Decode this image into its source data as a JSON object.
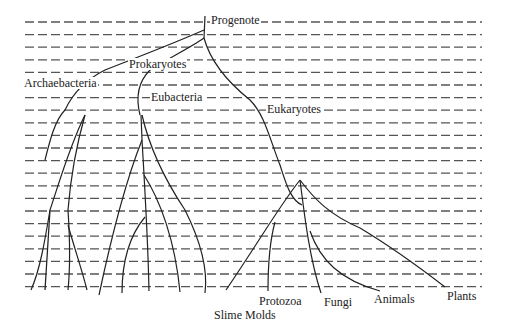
{
  "diagram": {
    "type": "phylogenetic-tree",
    "colors": {
      "line": "#222222",
      "dash": "#555555",
      "background": "#ffffff"
    },
    "nodes": {
      "root": "Progenote",
      "prokaryotes": "Prokaryotes",
      "archaebacteria": "Archaebacteria",
      "eubacteria": "Eubacteria",
      "eukaryotes": "Eukaryotes"
    },
    "leaves": {
      "slime_molds": "Slime Molds",
      "protozoa": "Protozoa",
      "fungi": "Fungi",
      "animals": "Animals",
      "plants": "Plants"
    },
    "time_lines": {
      "count": 22,
      "start_y": 22,
      "spacing": 12.6,
      "x_start": 25,
      "x_end": 482
    }
  }
}
